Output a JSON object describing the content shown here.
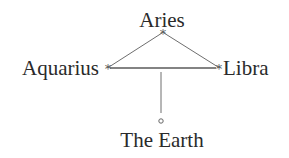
{
  "diagram": {
    "type": "astrological-configuration",
    "nodes": {
      "top": {
        "label": "Aries",
        "marker": "star"
      },
      "left": {
        "label": "Aquarius",
        "marker": "star"
      },
      "right": {
        "label": "Libra",
        "marker": "star"
      },
      "bottom": {
        "label": "The Earth",
        "marker": "circle"
      }
    },
    "edges": [
      {
        "from": "top",
        "to": "left"
      },
      {
        "from": "top",
        "to": "right"
      },
      {
        "from": "left",
        "to": "right"
      },
      {
        "from": "left-right-midpoint",
        "to": "bottom"
      }
    ],
    "star_glyph": "*",
    "colors": {
      "text": "#2a2a2a",
      "lines": "#6e6e6e",
      "background": "#ffffff"
    }
  }
}
